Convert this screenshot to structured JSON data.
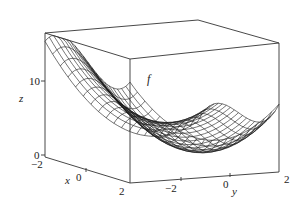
{
  "chart_data": {
    "type": "surface3d",
    "title": "",
    "surface_label": "f",
    "function_guess": "z = x^3 - 3x + y^2 + 2 (cubic ridge along x, parabolic along y)",
    "xlabel": "x",
    "ylabel": "y",
    "zlabel": "z",
    "x_range": [
      -2,
      2
    ],
    "y_range": [
      -3,
      2
    ],
    "z_range": [
      0,
      15
    ],
    "x_ticks": [
      "-2",
      "0",
      "2"
    ],
    "y_ticks": [
      "-2",
      "0",
      "2"
    ],
    "z_ticks": [
      "0",
      "10"
    ],
    "grid_lines": 20,
    "box": true,
    "colors": {
      "mesh": "#1a1a1a",
      "box": "#333333",
      "background": "#ffffff"
    }
  },
  "labels": {
    "z_axis": "z",
    "x_axis": "x",
    "y_axis": "y",
    "f": "f",
    "z10": "10",
    "z0": "0",
    "xm2": "−2",
    "x0": "0",
    "x2": "2",
    "ym2": "−2",
    "y0": "0",
    "y2": "2"
  }
}
